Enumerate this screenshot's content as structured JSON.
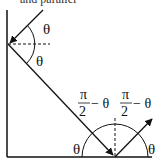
{
  "caption": {
    "text": "and parallel"
  },
  "diagram": {
    "type": "reflection-ray-diagram",
    "stroke_color": "#111111",
    "labels": {
      "theta_upper_left": "θ",
      "theta_lower_left": "θ",
      "frac_left_numerator": "π",
      "frac_left_denominator": "2",
      "frac_left_suffix": "− θ",
      "frac_right_numerator": "π",
      "frac_right_denominator": "2",
      "frac_right_suffix": "− θ",
      "theta_bottom_left": "θ",
      "theta_bottom_right": "θ"
    }
  }
}
